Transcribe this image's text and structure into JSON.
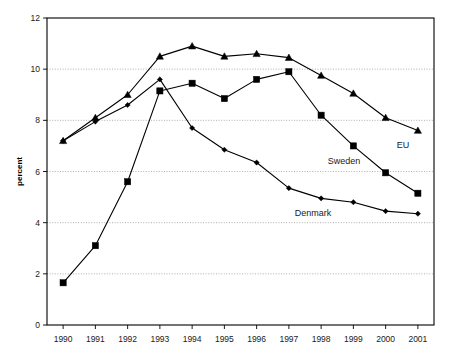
{
  "chart_data": {
    "type": "line",
    "title": "",
    "xlabel": "",
    "ylabel": "percent",
    "categories": [
      "1990",
      "1991",
      "1992",
      "1993",
      "1994",
      "1995",
      "1996",
      "1997",
      "1998",
      "1999",
      "2000",
      "2001"
    ],
    "ylim": [
      0,
      12
    ],
    "yticks": [
      "0",
      "2",
      "4",
      "6",
      "8",
      "10",
      "12"
    ],
    "grid": true,
    "legend_position": "inline-annotations",
    "series": [
      {
        "name": "EU",
        "marker": "triangle",
        "label": "EU",
        "values": [
          7.2,
          8.1,
          9.0,
          10.5,
          10.9,
          10.5,
          10.6,
          10.45,
          9.75,
          9.05,
          8.1,
          7.6
        ]
      },
      {
        "name": "Denmark",
        "marker": "diamond",
        "label": "Denmark",
        "values": [
          7.2,
          7.95,
          8.6,
          9.6,
          7.7,
          6.85,
          6.35,
          5.35,
          4.95,
          4.8,
          4.45,
          4.35
        ]
      },
      {
        "name": "Sweden",
        "marker": "square",
        "label": "Sweden",
        "values": [
          1.65,
          3.1,
          5.6,
          9.15,
          9.45,
          8.85,
          9.6,
          9.9,
          8.2,
          7.0,
          5.95,
          5.15
        ]
      }
    ],
    "annotations": [
      {
        "text": "EU",
        "series": "EU"
      },
      {
        "text": "Sweden",
        "series": "Sweden"
      },
      {
        "text": "Denmark",
        "series": "Denmark"
      }
    ]
  }
}
